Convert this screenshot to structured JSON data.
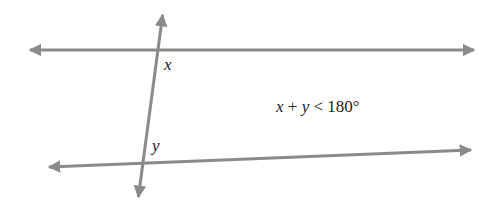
{
  "diagram": {
    "line_color": "#8a8a8a",
    "text_color": "#222222",
    "background": "#ffffff",
    "lines": [
      {
        "name": "top-line",
        "x1": 27,
        "y1": 50,
        "x2": 477,
        "y2": 50,
        "arrows": "both"
      },
      {
        "name": "bottom-line",
        "x1": 46,
        "y1": 167,
        "x2": 474,
        "y2": 150,
        "arrows": "both"
      },
      {
        "name": "transversal",
        "x1": 163,
        "y1": 12,
        "x2": 138,
        "y2": 200,
        "arrows": "both"
      }
    ],
    "angle_labels": {
      "x": "x",
      "y": "y"
    },
    "equation": {
      "var_x": "x",
      "plus": " + ",
      "var_y": "y",
      "relation": " < ",
      "value": "180°"
    }
  }
}
